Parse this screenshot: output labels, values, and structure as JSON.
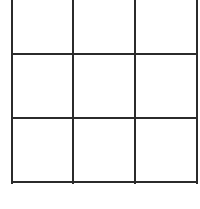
{
  "board": {
    "rows": 3,
    "cols": 3,
    "line_color": "#2b2b2b",
    "background": "#ffffff",
    "cells": [
      [
        "",
        "",
        ""
      ],
      [
        "",
        "",
        ""
      ],
      [
        "",
        "",
        ""
      ]
    ]
  }
}
